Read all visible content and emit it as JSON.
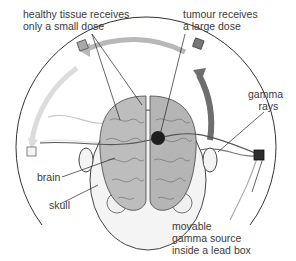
{
  "diagram": {
    "labels": {
      "healthy_line1": "healthy tissue receives",
      "healthy_line2": "only a small dose",
      "tumour_line1": "tumour receives",
      "tumour_line2": "a large dose",
      "gamma_line1": "gamma",
      "gamma_line2": "rays",
      "brain": "brain",
      "skull": "skull",
      "source_line1": "movable",
      "source_line2": "gamma source",
      "source_line3": "inside a lead box"
    },
    "colors": {
      "track": "#333333",
      "arrow_light": "#d9d9d9",
      "arrow_mid": "#b8b8b8",
      "arrow_dark": "#6e6e6e",
      "source_active": "#2e2e2e",
      "source_mid": "#777777",
      "source_light": "#a8a8a8",
      "source_faint": "#e0e0e0",
      "brain_fill": "#bdbdbd",
      "tumour": "#1e1e1e"
    }
  }
}
